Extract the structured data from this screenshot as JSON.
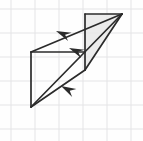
{
  "figure": {
    "canvas": {
      "width": 143,
      "height": 141,
      "background": "#fefefe"
    },
    "grid": {
      "visible": true,
      "spacing": 24,
      "origin_x": 11,
      "origin_y": 9,
      "color": "#e4e4e6",
      "line_width": 1
    },
    "style": {
      "stroke_color": "#2b2b2b",
      "stroke_width": 1.7,
      "shade_fill": "#e9e9e9",
      "shade_opacity": 0.85
    },
    "vertices": {
      "top_right": {
        "x": 122,
        "y": 14,
        "label": "A"
      },
      "top_mid": {
        "x": 85,
        "y": 14,
        "label": "B"
      },
      "mid_left": {
        "x": 31,
        "y": 52,
        "label": "C"
      },
      "mid_right": {
        "x": 85,
        "y": 70,
        "label": "D"
      },
      "bottom_left": {
        "x": 31,
        "y": 107,
        "label": "E"
      }
    },
    "shaded_face": {
      "name": "shaded-triangle-face",
      "points": "85,14 122,14 85,70",
      "fill": "#e9e9e9"
    },
    "edges": [
      {
        "name": "edge-top",
        "x1": 85,
        "y1": 14,
        "x2": 122,
        "y2": 14
      },
      {
        "name": "edge-vertical-middle",
        "x1": 85,
        "y1": 14,
        "x2": 85,
        "y2": 70
      },
      {
        "name": "edge-vertical-left",
        "x1": 31,
        "y1": 52,
        "x2": 31,
        "y2": 107
      },
      {
        "name": "edge-mid-horizontal",
        "x1": 31,
        "y1": 52,
        "x2": 85,
        "y2": 52
      },
      {
        "name": "edge-diagonal-upper",
        "x1": 122,
        "y1": 14,
        "x2": 31,
        "y2": 52
      },
      {
        "name": "edge-diagonal-lower-right",
        "x1": 122,
        "y1": 14,
        "x2": 85,
        "y2": 70
      },
      {
        "name": "edge-bottom-diagonal",
        "x1": 85,
        "y1": 70,
        "x2": 31,
        "y2": 107
      },
      {
        "name": "edge-long-diagonal",
        "x1": 122,
        "y1": 14,
        "x2": 31,
        "y2": 107
      }
    ],
    "arrows": [
      {
        "name": "arrow-upper-left",
        "tip_x": 56,
        "tip_y": 31,
        "angle_deg": 203,
        "length": 15,
        "on_edge": "edge-diagonal-upper",
        "direction": "up-left"
      },
      {
        "name": "arrow-middle",
        "tip_x": 69,
        "tip_y": 48,
        "angle_deg": 203,
        "length": 15,
        "on_edge": "edge-long-diagonal",
        "direction": "up-left"
      },
      {
        "name": "arrow-lower-left",
        "tip_x": 61,
        "tip_y": 86,
        "angle_deg": 208,
        "length": 15,
        "on_edge": "edge-bottom-diagonal",
        "direction": "down-left"
      }
    ]
  }
}
